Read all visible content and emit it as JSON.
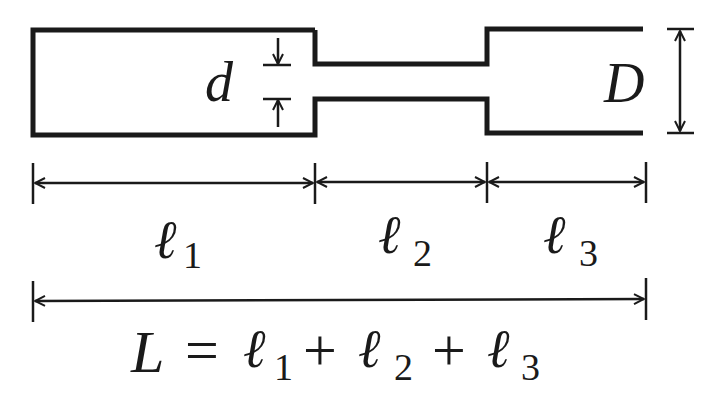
{
  "diagram": {
    "colors": {
      "stroke": "#1a1a1a",
      "background": "#ffffff"
    },
    "labels": {
      "small_diameter": "d",
      "large_diameter": "D",
      "l1": {
        "base": "ℓ",
        "sub": "1"
      },
      "l2": {
        "base": "ℓ",
        "sub": "2"
      },
      "l3": {
        "base": "ℓ",
        "sub": "3"
      }
    },
    "equation": {
      "lhs": "L",
      "eq": "=",
      "plus": "+",
      "terms": [
        {
          "base": "ℓ",
          "sub": "1"
        },
        {
          "base": "ℓ",
          "sub": "2"
        },
        {
          "base": "ℓ",
          "sub": "3"
        }
      ]
    },
    "segments": [
      "ℓ1",
      "ℓ2",
      "ℓ3"
    ]
  }
}
